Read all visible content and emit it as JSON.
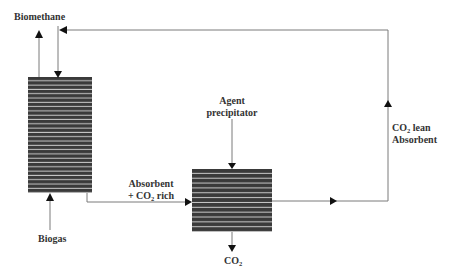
{
  "diagram": {
    "type": "process-flow",
    "colors": {
      "column_fill": "#3a3a3a",
      "column_stripe": "#c8c8c8",
      "line": "#7a7a7a",
      "arrow": "#111111",
      "text": "#333333"
    },
    "units": [
      {
        "id": "absorber-column",
        "x": 28,
        "y": 77,
        "w": 64,
        "h": 116,
        "stripes": 27
      },
      {
        "id": "precipitator-column",
        "x": 192,
        "y": 169,
        "w": 80,
        "h": 63,
        "stripes": 13
      }
    ],
    "labels": {
      "biomethane": "Biomethane",
      "biogas": "Biogas",
      "absorbent_rich_line1": "Absorbent",
      "absorbent_rich_line2_prefix": "+ CO",
      "absorbent_rich_line2_sub": "2",
      "absorbent_rich_line2_suffix": " rich",
      "agent_line1": "Agent",
      "agent_line2": "precipitator",
      "co2_out_prefix": "CO",
      "co2_out_sub": "2",
      "lean_line1_prefix": "CO",
      "lean_line1_sub": "2",
      "lean_line1_suffix": " lean",
      "lean_line2": "Absorbent"
    },
    "streams": [
      {
        "from": "Biogas",
        "to": "absorber-column"
      },
      {
        "from": "absorber-column",
        "to": "Biomethane"
      },
      {
        "from": "absorber-column",
        "to": "precipitator-column",
        "label": "Absorbent + CO2 rich"
      },
      {
        "from": "Agent precipitator",
        "to": "precipitator-column"
      },
      {
        "from": "precipitator-column",
        "to": "CO2"
      },
      {
        "from": "precipitator-column",
        "to": "absorber-column",
        "label": "CO2 lean Absorbent"
      }
    ]
  }
}
